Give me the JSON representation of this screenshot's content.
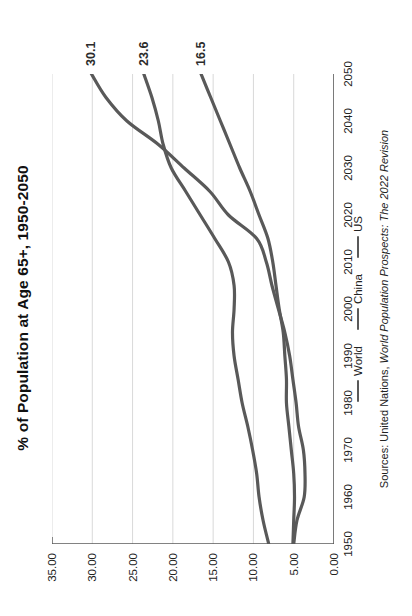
{
  "title": "% of Population at Age 65+, 1950-2050",
  "source": {
    "prefix": "Sources: United Nations, ",
    "publication": "World Population Prospects: The 2022 Revision"
  },
  "legend": {
    "position": "bottom",
    "items": [
      {
        "label": "World",
        "color": "#595959"
      },
      {
        "label": "China",
        "color": "#595959"
      },
      {
        "label": "US",
        "color": "#595959"
      }
    ]
  },
  "end_labels": [
    {
      "series": "China",
      "text": "30.1"
    },
    {
      "series": "US",
      "text": "23.6"
    },
    {
      "series": "World",
      "text": "16.5"
    }
  ],
  "axes": {
    "y_ticks": [
      "0.00",
      "5.00",
      "10.00",
      "15.00",
      "20.00",
      "25.00",
      "30.00",
      "35.00"
    ],
    "x_ticks": [
      "1950",
      "1960",
      "1970",
      "1980",
      "1990",
      "2000",
      "2010",
      "2020",
      "2030",
      "2040",
      "2050"
    ]
  },
  "colors": {
    "line": "#595959",
    "grid": "#d9d9d9",
    "axis": "#595959",
    "text": "#222222"
  },
  "chart_data": {
    "type": "line",
    "title": "% of Population at Age 65+, 1950-2050",
    "xlabel": "",
    "ylabel": "",
    "xlim": [
      1950,
      2050
    ],
    "ylim": [
      0,
      35
    ],
    "grid": true,
    "legend_position": "bottom",
    "x": [
      1950,
      1955,
      1960,
      1965,
      1970,
      1975,
      1980,
      1985,
      1990,
      1995,
      2000,
      2005,
      2010,
      2015,
      2020,
      2025,
      2030,
      2035,
      2040,
      2045,
      2050
    ],
    "series": [
      {
        "name": "World",
        "values": [
          5.1,
          5.0,
          4.9,
          5.0,
          5.3,
          5.6,
          5.9,
          5.9,
          6.1,
          6.3,
          6.8,
          7.2,
          7.6,
          8.2,
          9.3,
          10.4,
          11.7,
          12.9,
          14.1,
          15.3,
          16.5
        ],
        "end_label": "16.5"
      },
      {
        "name": "China",
        "values": [
          5.0,
          4.6,
          3.7,
          3.6,
          3.8,
          4.4,
          4.7,
          5.1,
          5.5,
          6.1,
          6.9,
          7.7,
          8.4,
          9.6,
          13.1,
          15.4,
          18.6,
          21.8,
          25.7,
          28.3,
          30.1
        ],
        "end_label": "30.1"
      },
      {
        "name": "US",
        "values": [
          8.1,
          8.8,
          9.3,
          9.6,
          10.1,
          10.7,
          11.4,
          11.9,
          12.4,
          12.6,
          12.4,
          12.4,
          13.1,
          14.8,
          16.6,
          18.4,
          20.2,
          21.2,
          21.8,
          22.6,
          23.6
        ],
        "end_label": "23.6"
      }
    ]
  }
}
